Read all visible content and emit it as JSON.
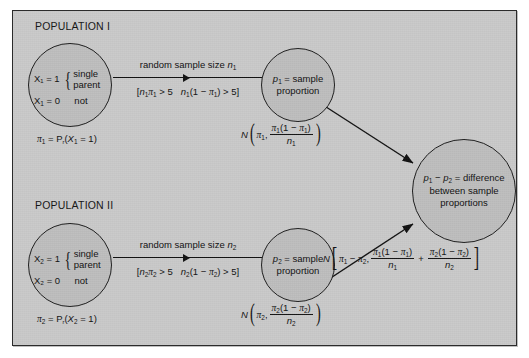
{
  "figure": {
    "type": "statistical-flow-diagram",
    "title_visible": false,
    "background_color": "#c9c9c9",
    "border_color": "#2b2b2b",
    "node_fill_color": "#bdbdbd",
    "ink_color": "#101010"
  },
  "populations": [
    {
      "id": "population-1",
      "label": "POPULATION I",
      "circle": {
        "success_line": "X₁ = 1",
        "brace_line_1": "single",
        "brace_line_2": "parent",
        "failure_line": "X₂ = 0",
        "failure_value": "not"
      },
      "parameter": "π₁ = Pᵣ(X₁ = 1)",
      "arrow": {
        "caption": "random sample size n₁",
        "condition": "[n₁π₁ > 5   n₁(1 − π₁) > 5]",
        "condition_open": "[",
        "condition_part_1": "n₁π₁ > 5",
        "condition_part_2": "n₁(1 − π₁) > 5",
        "condition_close": "]"
      },
      "statistic": {
        "line_1": "p₁ = sample",
        "line_2": "proportion"
      },
      "distribution": {
        "symbol": "N",
        "mean": "π₁,",
        "variance_numerator": "π₁(1 − π₁)",
        "variance_denominator": "n₁"
      }
    },
    {
      "id": "population-2",
      "label": "POPULATION II",
      "circle": {
        "success_line": "X₂ = 1",
        "brace_line_1": "single",
        "brace_line_2": "parent",
        "failure_line": "X₂ = 0",
        "failure_value": "not"
      },
      "parameter": "π₂ = Pᵣ(X₂ = 1)",
      "arrow": {
        "caption": "random sample size n₂",
        "condition": "[n₂π₂ > 5   n₂(1 − π₂) > 5]",
        "condition_open": "[",
        "condition_part_1": "n₂π₂ > 5",
        "condition_part_2": "n₂(1 − π₂) > 5",
        "condition_close": "]"
      },
      "statistic": {
        "line_1": "p₂ = sample",
        "line_2": "proportion"
      },
      "distribution": {
        "symbol": "N",
        "mean": "π₂,",
        "variance_numerator": "π₂(1 − π₂)",
        "variance_denominator": "n₂"
      }
    }
  ],
  "difference_node": {
    "line_1": "p₁ − p₂ = difference",
    "line_2": "between sample",
    "line_3": "proportions"
  },
  "difference_distribution": {
    "symbol": "N",
    "open_bracket": "[",
    "mean": "π₁ − π₂,",
    "term_1_numerator": "π₁(1 − π₁)",
    "term_1_denominator": "n₁",
    "plus": "+",
    "term_2_numerator": "π₂(1 − π₂)",
    "term_2_denominator": "n₂",
    "close_bracket": "]"
  }
}
